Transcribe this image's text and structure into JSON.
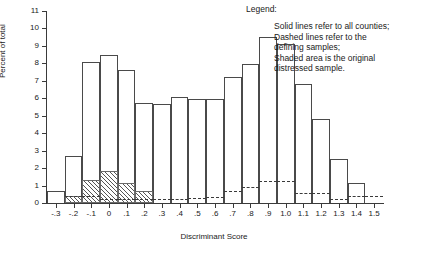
{
  "legend": {
    "title": "Legend:",
    "body": "Solid lines refer to all counties;\nDashed lines refer to the\ndefining samples;\nShaded area is the original\ndistressed sample."
  },
  "chart_data": {
    "type": "bar",
    "title": "",
    "xlabel": "Discriminant Score",
    "ylabel": "Percent of total",
    "xlim": [
      -0.35,
      1.55
    ],
    "ylim": [
      0,
      11
    ],
    "grid": false,
    "legend_position": "top-right",
    "bin_width": 0.1,
    "xticks": [
      "-.3",
      "-.2",
      "-.1",
      "0",
      ".1",
      ".2",
      ".3",
      ".4",
      ".5",
      ".6",
      ".7",
      ".8",
      ".9",
      "1.0",
      "1.1",
      "1.2",
      "1.3",
      "1.4",
      "1.5"
    ],
    "xtick_values": [
      -0.3,
      -0.2,
      -0.1,
      0.0,
      0.1,
      0.2,
      0.3,
      0.4,
      0.5,
      0.6,
      0.7,
      0.8,
      0.9,
      1.0,
      1.1,
      1.2,
      1.3,
      1.4,
      1.5
    ],
    "yticks": [
      "0",
      "1",
      "2",
      "3",
      "4",
      "5",
      "6",
      "7",
      "8",
      "9",
      "10",
      "11"
    ],
    "ytick_values": [
      0,
      1,
      2,
      3,
      4,
      5,
      6,
      7,
      8,
      9,
      10,
      11
    ],
    "bin_starts": [
      -0.35,
      -0.25,
      -0.15,
      -0.05,
      0.05,
      0.15,
      0.25,
      0.35,
      0.45,
      0.55,
      0.65,
      0.75,
      0.85,
      0.95,
      1.05,
      1.15,
      1.25,
      1.35,
      1.45
    ],
    "series": [
      {
        "name": "Solid lines refer to all counties",
        "style": "solid",
        "values": [
          0.7,
          2.7,
          8.1,
          8.5,
          7.6,
          5.75,
          5.65,
          6.05,
          5.95,
          5.95,
          7.2,
          7.95,
          9.5,
          9.1,
          6.8,
          4.8,
          2.5,
          1.15,
          0.0
        ]
      },
      {
        "name": "Dashed lines refer to the defining samples",
        "style": "dashed",
        "values": [
          0.0,
          0.4,
          0.4,
          0.25,
          0.25,
          0.25,
          0.25,
          0.25,
          0.3,
          0.35,
          0.7,
          0.9,
          1.25,
          1.25,
          0.6,
          0.6,
          0.25,
          0.4,
          0.4
        ]
      },
      {
        "name": "Shaded area is the original distressed sample",
        "style": "shaded",
        "values": [
          0.0,
          0.4,
          1.3,
          1.85,
          1.15,
          0.7,
          0.0,
          0.0,
          0.0,
          0.0,
          0.0,
          0.0,
          0.0,
          0.0,
          0.0,
          0.0,
          0.0,
          0.0,
          0.0
        ]
      }
    ]
  }
}
